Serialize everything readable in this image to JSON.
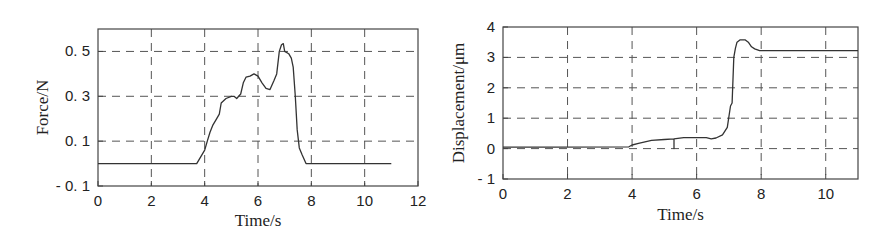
{
  "chart_data": [
    {
      "type": "line",
      "title": "",
      "xlabel": "Time/s",
      "ylabel": "Force/N",
      "xlim": [
        0,
        12
      ],
      "ylim": [
        -0.1,
        0.6
      ],
      "xticks": [
        0,
        2,
        4,
        6,
        8,
        10,
        12
      ],
      "xtick_labels": [
        "0",
        "2",
        "4",
        "6",
        "8",
        "10",
        "12"
      ],
      "yticks": [
        -0.1,
        0.1,
        0.3,
        0.5
      ],
      "ytick_labels": [
        "- 0. 1",
        "0. 1",
        "0. 3",
        "0. 5"
      ],
      "grid": true,
      "series": [
        {
          "name": "Force",
          "x": [
            0,
            3.7,
            3.85,
            4.0,
            4.1,
            4.2,
            4.3,
            4.45,
            4.55,
            4.62,
            4.8,
            5.0,
            5.1,
            5.2,
            5.35,
            5.45,
            5.55,
            5.7,
            5.85,
            6.0,
            6.15,
            6.3,
            6.45,
            6.6,
            6.7,
            6.8,
            6.88,
            6.95,
            7.0,
            7.15,
            7.25,
            7.32,
            7.4,
            7.47,
            7.55,
            7.65,
            7.8,
            11.0
          ],
          "y": [
            0.0,
            0.0,
            0.03,
            0.06,
            0.1,
            0.14,
            0.17,
            0.2,
            0.22,
            0.27,
            0.29,
            0.3,
            0.3,
            0.29,
            0.31,
            0.36,
            0.385,
            0.39,
            0.4,
            0.39,
            0.36,
            0.335,
            0.33,
            0.37,
            0.4,
            0.5,
            0.53,
            0.535,
            0.5,
            0.49,
            0.47,
            0.43,
            0.3,
            0.15,
            0.07,
            0.04,
            0.0,
            0.0
          ]
        }
      ]
    },
    {
      "type": "line",
      "title": "",
      "xlabel": "Time/s",
      "ylabel": "Displacement/μm",
      "xlim": [
        0,
        11
      ],
      "ylim": [
        -1,
        4
      ],
      "xticks": [
        0,
        2,
        4,
        6,
        8,
        10
      ],
      "xtick_labels": [
        "0",
        "2",
        "4",
        "6",
        "8",
        "10"
      ],
      "yticks": [
        -1,
        0,
        1,
        2,
        3,
        4
      ],
      "ytick_labels": [
        "- 1",
        "0",
        "1",
        "2",
        "3",
        "4"
      ],
      "grid": true,
      "series": [
        {
          "name": "Displacement",
          "x": [
            0,
            1.6,
            3.9,
            4.0,
            4.2,
            4.4,
            4.6,
            5.0,
            5.3,
            5.3,
            5.3,
            5.6,
            6.3,
            6.45,
            6.6,
            6.8,
            6.95,
            7.05,
            7.1,
            7.15,
            7.2,
            7.25,
            7.35,
            7.5,
            7.6,
            7.7,
            7.8,
            7.95,
            11.0
          ],
          "y": [
            0.05,
            0.05,
            0.06,
            0.12,
            0.17,
            0.22,
            0.27,
            0.3,
            0.32,
            0.0,
            0.32,
            0.36,
            0.36,
            0.32,
            0.35,
            0.45,
            0.7,
            1.4,
            1.5,
            3.0,
            3.3,
            3.5,
            3.58,
            3.58,
            3.5,
            3.35,
            3.28,
            3.22,
            3.22
          ]
        }
      ]
    }
  ]
}
